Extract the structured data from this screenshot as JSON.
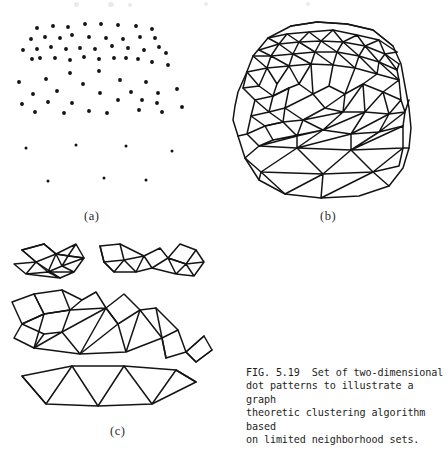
{
  "figure": {
    "label_a": "(a)",
    "label_b": "(b)",
    "label_c": "(c)",
    "caption": "FIG. 5.19  Set of two-dimensional\ndot patterns to illustrate a graph\ntheoretic clustering algorithm based\non limited neighborhood sets.",
    "ink_color": "#141414",
    "paper_color": "#ffffff"
  },
  "chart_data": {
    "type": "scatter",
    "title": "FIG. 5.19  Set of two-dimensional dot patterns to illustrate a graph theoretic clustering algorithm based on limited neighborhood sets.",
    "xlabel": "",
    "ylabel": "",
    "grid": false,
    "legend": "none",
    "panels": [
      {
        "id": "a",
        "label": "(a)",
        "type": "scatter",
        "description": "Two-dimensional dot pattern: dense upper cloud plus sparse lower points",
        "xlim": [
          0,
          215
        ],
        "ylim": [
          0,
          200
        ],
        "points": [
          [
            37,
            20
          ],
          [
            53,
            18
          ],
          [
            68,
            19
          ],
          [
            85,
            16
          ],
          [
            101,
            16
          ],
          [
            118,
            17
          ],
          [
            136,
            18
          ],
          [
            152,
            21
          ],
          [
            31,
            31
          ],
          [
            45,
            29
          ],
          [
            60,
            30
          ],
          [
            72,
            27
          ],
          [
            89,
            29
          ],
          [
            106,
            30
          ],
          [
            123,
            31
          ],
          [
            140,
            29
          ],
          [
            155,
            30
          ],
          [
            23,
            42
          ],
          [
            37,
            41
          ],
          [
            51,
            39
          ],
          [
            66,
            41
          ],
          [
            80,
            40
          ],
          [
            95,
            41
          ],
          [
            112,
            38
          ],
          [
            128,
            40
          ],
          [
            144,
            42
          ],
          [
            159,
            39
          ],
          [
            32,
            51
          ],
          [
            40,
            50
          ],
          [
            55,
            50
          ],
          [
            70,
            52
          ],
          [
            84,
            49
          ],
          [
            99,
            51
          ],
          [
            114,
            50
          ],
          [
            126,
            50
          ],
          [
            138,
            51
          ],
          [
            152,
            54
          ],
          [
            166,
            45
          ],
          [
            168,
            57
          ],
          [
            70,
            65
          ],
          [
            99,
            63
          ],
          [
            19,
            74
          ],
          [
            46,
            71
          ],
          [
            83,
            76
          ],
          [
            120,
            72
          ],
          [
            146,
            74
          ],
          [
            33,
            86
          ],
          [
            57,
            83
          ],
          [
            100,
            85
          ],
          [
            131,
            84
          ],
          [
            158,
            85
          ],
          [
            177,
            81
          ],
          [
            22,
            96
          ],
          [
            48,
            94
          ],
          [
            72,
            95
          ],
          [
            118,
            92
          ],
          [
            142,
            92
          ],
          [
            157,
            95
          ],
          [
            35,
            104
          ],
          [
            64,
            105
          ],
          [
            89,
            103
          ],
          [
            107,
            105
          ],
          [
            139,
            102
          ],
          [
            162,
            104
          ],
          [
            182,
            99
          ],
          [
            26,
            140
          ],
          [
            76,
            137
          ],
          [
            126,
            138
          ],
          [
            172,
            143
          ],
          [
            48,
            173
          ],
          [
            104,
            170
          ],
          [
            146,
            172
          ]
        ]
      },
      {
        "id": "b",
        "label": "(b)",
        "type": "graph",
        "description": "Limited neighborhood graph built on the dot pattern: dense triangulated mesh in the upper region, large triangles below"
      },
      {
        "id": "c",
        "label": "(c)",
        "type": "graph",
        "description": "Three separated clusters produced by the clustering algorithm: a dense double-strip, a mid-density quadrilateral chain, and a sparse triangle strip"
      }
    ]
  }
}
